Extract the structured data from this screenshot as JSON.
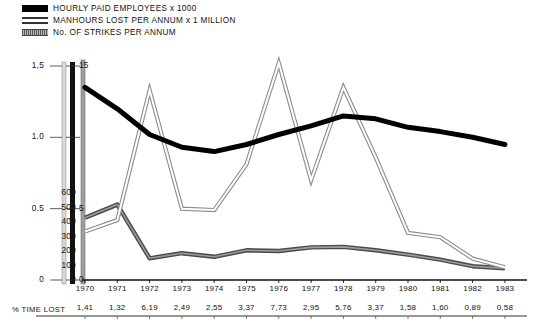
{
  "legend": {
    "items": [
      {
        "label": "HOURLY PAID EMPLOYEES x 1000",
        "style": "solid-black",
        "color": "#000000"
      },
      {
        "label": "MANHOURS LOST PER ANNUM x 1 MILLION",
        "style": "hollow-outline",
        "color": "#333333"
      },
      {
        "label": "No. OF STRIKES PER ANNUM",
        "style": "gray-hatched",
        "color": "#555555"
      }
    ]
  },
  "axes": {
    "left": {
      "title": "",
      "ticks": [
        "0",
        "0.5",
        "1.0",
        "1,5"
      ],
      "values": [
        0,
        0.5,
        1.0,
        1.5
      ],
      "min": 0,
      "max": 1.5
    },
    "middle": {
      "title": "",
      "ticks": [
        "0",
        "5",
        "15"
      ],
      "values": [
        0,
        5,
        15
      ],
      "min": 0,
      "max": 15
    },
    "third": {
      "title": "",
      "ticks": [
        "0",
        "100",
        "200",
        "300",
        "400",
        "500",
        "600"
      ],
      "values": [
        0,
        100,
        200,
        300,
        400,
        500,
        600
      ],
      "min": 0,
      "max": 600
    }
  },
  "pct_row": {
    "title": "% TIME LOST",
    "values": [
      "1,41",
      "1,32",
      "6,19",
      "2,49",
      "2,55",
      "3,37",
      "7,73",
      "2,95",
      "5,76",
      "3,37",
      "1,58",
      "1,60",
      "0,89",
      "0,58"
    ]
  },
  "chart_data": {
    "type": "line",
    "title": "",
    "xlabel": "",
    "ylabel": "",
    "grid": false,
    "legend_position": "top-left",
    "categories": [
      "1970",
      "1971",
      "1972",
      "1973",
      "1974",
      "1975",
      "1976",
      "1977",
      "1978",
      "1979",
      "1980",
      "1981",
      "1982",
      "1983"
    ],
    "x": [
      1970,
      1971,
      1972,
      1973,
      1974,
      1975,
      1976,
      1977,
      1978,
      1979,
      1980,
      1981,
      1982,
      1983
    ],
    "series": [
      {
        "name": "HOURLY PAID EMPLOYEES x 1000",
        "axis": "left",
        "ylim": [
          0,
          1.5
        ],
        "style": "solid-black",
        "values": [
          1.35,
          1.2,
          1.02,
          0.93,
          0.9,
          0.95,
          1.02,
          1.08,
          1.15,
          1.13,
          1.07,
          1.04,
          1.0,
          0.95
        ]
      },
      {
        "name": "MANHOURS LOST PER ANNUM x 1 MILLION",
        "axis": "middle",
        "ylim": [
          0,
          15
        ],
        "style": "hollow-outline",
        "values": [
          3.4,
          4.2,
          13.3,
          5.0,
          4.9,
          8.1,
          15.2,
          7.0,
          13.5,
          8.6,
          3.3,
          3.0,
          1.5,
          0.9
        ]
      },
      {
        "name": "No. OF STRIKES PER ANNUM",
        "axis": "third",
        "ylim": [
          0,
          600
        ],
        "style": "gray-hatched",
        "values": [
          430,
          520,
          150,
          185,
          160,
          205,
          200,
          225,
          228,
          205,
          175,
          140,
          95,
          80
        ]
      }
    ],
    "pct_time_lost": {
      "label": "% TIME LOST",
      "values": [
        1.41,
        1.32,
        6.19,
        2.49,
        2.55,
        3.37,
        7.73,
        2.95,
        5.76,
        3.37,
        1.58,
        1.6,
        0.89,
        0.58
      ]
    }
  }
}
